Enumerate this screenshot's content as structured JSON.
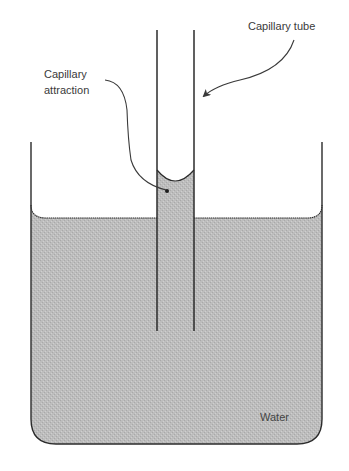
{
  "diagram": {
    "type": "capillary-action-illustration",
    "labels": {
      "capillary_tube": "Capillary tube",
      "capillary_attraction_line1": "Capillary",
      "capillary_attraction_line2": "attraction",
      "water": "Water"
    },
    "colors": {
      "water_fill": "#bcbcbc",
      "water_texture": "#a8a8a8",
      "outline": "#2b2b2b",
      "leader_line": "#3a3a3a",
      "background": "#ffffff"
    },
    "elements": [
      {
        "name": "container",
        "description": "Open-topped vessel with rounded bottom corners"
      },
      {
        "name": "water-body",
        "description": "Water filling the container with meniscus curving up at walls"
      },
      {
        "name": "capillary-tube",
        "description": "Narrow open tube dipped into the water"
      },
      {
        "name": "raised-water-column",
        "description": "Water risen inside the tube above outside level, with concave meniscus"
      }
    ]
  }
}
